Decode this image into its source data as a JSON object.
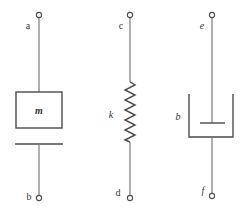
{
  "diagram": {
    "elements": [
      {
        "type": "mass",
        "symbol": "m",
        "top_terminal": "a",
        "bottom_terminal": "b"
      },
      {
        "type": "spring",
        "symbol": "k",
        "top_terminal": "c",
        "bottom_terminal": "d"
      },
      {
        "type": "damper",
        "symbol": "b",
        "top_terminal": "e",
        "bottom_terminal": "f"
      }
    ],
    "colors": {
      "line": "#4a4a4a",
      "wire": "#7a7a7a",
      "background": "#ffffff"
    }
  }
}
